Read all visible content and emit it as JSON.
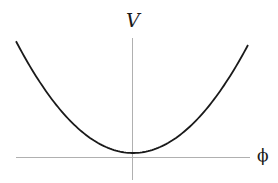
{
  "figure": {
    "axes": {
      "vertical_label": "V",
      "horizontal_label": "ϕ",
      "axis_color": "#b0b0b0",
      "curve_color": "#1a1a1a"
    },
    "curve": {
      "type": "parabola",
      "shape": "V(ϕ) = a·ϕ² + c, c > 0",
      "minimum_at": "ϕ = 0",
      "points_px": [
        [
          16,
          45
        ],
        [
          40,
          84.8
        ],
        [
          60,
          111
        ],
        [
          90,
          138.4
        ],
        [
          110,
          148.8
        ],
        [
          133,
          153
        ],
        [
          156,
          148.8
        ],
        [
          176,
          138.4
        ],
        [
          206,
          111
        ],
        [
          226,
          89
        ],
        [
          248,
          45
        ]
      ]
    }
  }
}
